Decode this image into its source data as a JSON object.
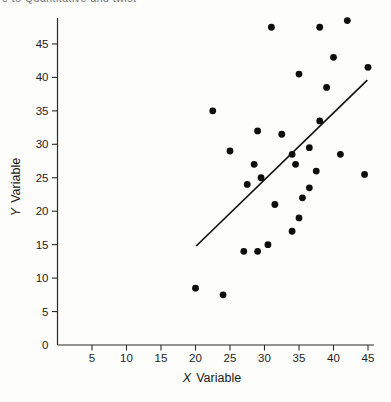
{
  "page": {
    "clipped_header": "e to Quantitative and twist",
    "background": "#fdfdfb"
  },
  "chart_data": {
    "type": "scatter",
    "title": "",
    "xlabel": "X Variable",
    "xlabel_prefix": "X",
    "xlabel_word": "Variable",
    "ylabel": "Y Variable",
    "ylabel_prefix": "Y",
    "ylabel_word": "Variable",
    "xlim": [
      0,
      46
    ],
    "ylim": [
      0,
      49
    ],
    "x_ticks": [
      5,
      10,
      15,
      20,
      25,
      30,
      35,
      40,
      45
    ],
    "y_ticks": [
      5,
      10,
      15,
      20,
      25,
      30,
      35,
      40,
      45
    ],
    "y_zero_label": "0",
    "grid": false,
    "legend": false,
    "point_color": "#0d0d0d",
    "line_color": "#0d0d0d",
    "axis_color": "#2b2b2b",
    "points": [
      [
        31,
        47.5
      ],
      [
        38,
        47.5
      ],
      [
        42,
        48.5
      ],
      [
        40,
        43
      ],
      [
        45,
        41.5
      ],
      [
        35,
        40.5
      ],
      [
        39,
        38.5
      ],
      [
        22.5,
        35
      ],
      [
        38,
        33.5
      ],
      [
        29,
        32
      ],
      [
        32.5,
        31.5
      ],
      [
        25,
        29
      ],
      [
        36.5,
        29.5
      ],
      [
        34,
        28.5
      ],
      [
        41,
        28.5
      ],
      [
        34.5,
        27
      ],
      [
        28.5,
        27
      ],
      [
        37.5,
        26
      ],
      [
        29.5,
        25
      ],
      [
        44.5,
        25.5
      ],
      [
        27.5,
        24
      ],
      [
        36.5,
        23.5
      ],
      [
        35.5,
        22
      ],
      [
        31.5,
        21
      ],
      [
        35,
        19
      ],
      [
        34,
        17
      ],
      [
        30.5,
        15
      ],
      [
        27,
        14
      ],
      [
        29,
        14
      ],
      [
        20,
        8.5
      ],
      [
        24,
        7.5
      ]
    ],
    "regression_line": {
      "x1": 20.1,
      "y1": 14.8,
      "x2": 44.9,
      "y2": 39.6
    }
  }
}
